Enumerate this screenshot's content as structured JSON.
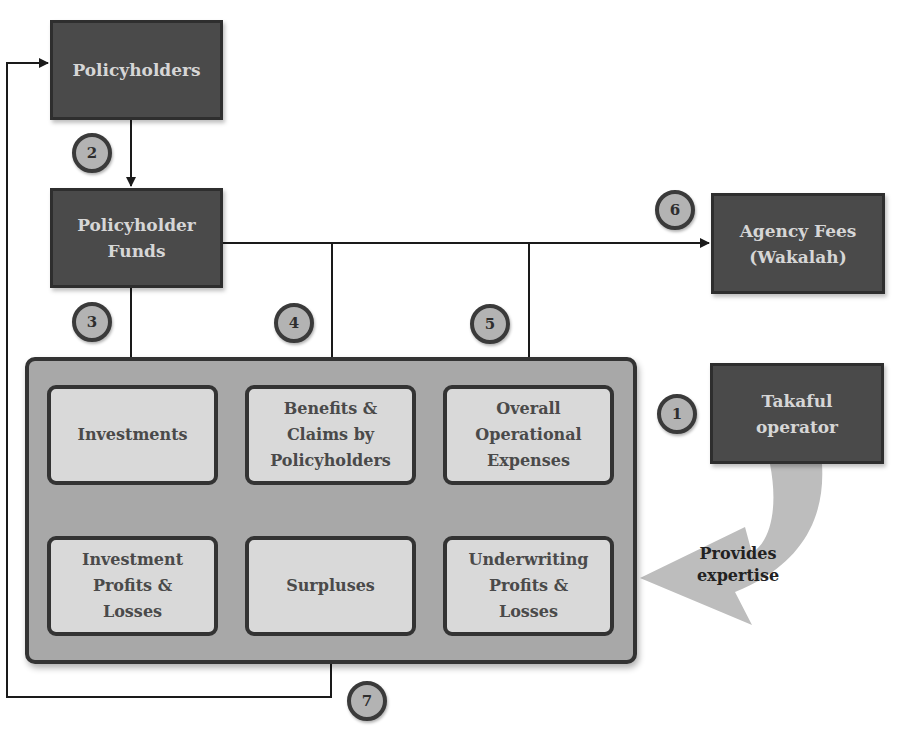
{
  "diagram": {
    "nodes": {
      "policyholders": "Policyholders",
      "policyholder_funds": "Policyholder\nFunds",
      "agency_fees": "Agency Fees\n(Wakalah)",
      "takaful_operator": "Takaful\noperator",
      "investments": "Investments",
      "benefits_claims": "Benefits &\nClaims by\nPolicyholders",
      "operational_expenses": "Overall\nOperational\nExpenses",
      "investment_profits": "Investment\nProfits &\nLosses",
      "surpluses": "Surpluses",
      "underwriting_profits": "Underwriting\nProfits &\nLosses"
    },
    "badges": {
      "b1": "1",
      "b2": "2",
      "b3": "3",
      "b4": "4",
      "b5": "5",
      "b6": "6",
      "b7": "7"
    },
    "annotations": {
      "provides_expertise": "Provides\nexpertise"
    },
    "colors": {
      "dark_box": "#4a4a4a",
      "light_box": "#d9d9d9",
      "container": "#a8a8a8",
      "badge": "#b3b3b3",
      "expertise_arrow": "#bdbdbd",
      "line": "#1a1a1a"
    }
  }
}
